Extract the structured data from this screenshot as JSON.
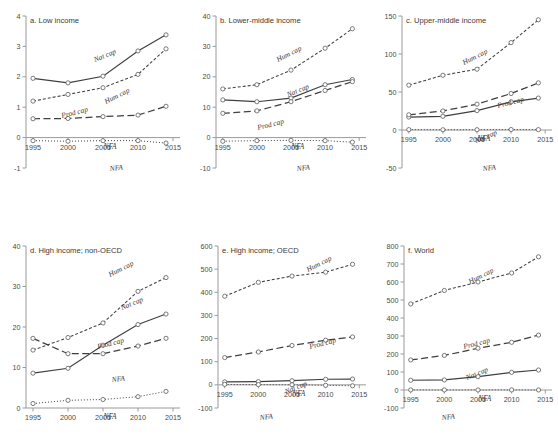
{
  "figure": {
    "title": "",
    "panel_count": 6,
    "xlabel": "",
    "x_categories": [
      1995,
      2000,
      2005,
      2010,
      2014
    ],
    "x_ticks": [
      "1995",
      "2000",
      "2005",
      "2010",
      "2015"
    ],
    "xlim": [
      1994,
      2016
    ],
    "nfa_axis_label": "NFA",
    "series_names": [
      "Nat cap",
      "Hum cap",
      "Prod cap",
      "NFA"
    ],
    "styles": {
      "Nat cap": "solid",
      "Hum cap": "short-dash",
      "Prod cap": "long-dash",
      "NFA": "dotted"
    },
    "colors": {
      "line": "#3f3f3f",
      "axis": "#9a9a9a",
      "text": "#3a3a3a",
      "marker_fill": "#ffffff"
    }
  },
  "chart_data": [
    {
      "type": "line",
      "panel": "a",
      "title": "a. Low income",
      "xlabel": "",
      "ylabel": "",
      "x": [
        1995,
        2000,
        2005,
        2010,
        2014
      ],
      "xticklabels": [
        "1995",
        "2000",
        "2005",
        "2010",
        "2015"
      ],
      "ylim": [
        -1,
        4
      ],
      "yticks": [
        -1,
        0,
        1,
        2,
        3,
        4
      ],
      "yticklabels": [
        "-1",
        "0",
        "1",
        "2",
        "3",
        "4"
      ],
      "grid": false,
      "legend": "inline-labels",
      "series": [
        {
          "name": "Nat cap",
          "values": [
            1.95,
            1.8,
            2.02,
            2.85,
            3.38
          ]
        },
        {
          "name": "Hum cap",
          "values": [
            1.2,
            1.42,
            1.64,
            2.08,
            2.92
          ]
        },
        {
          "name": "Prod cap",
          "values": [
            0.62,
            0.63,
            0.69,
            0.74,
            1.03
          ]
        },
        {
          "name": "NFA",
          "values": [
            -0.1,
            -0.12,
            -0.1,
            -0.1,
            -0.18
          ]
        }
      ]
    },
    {
      "type": "line",
      "panel": "b",
      "title": "b. Lower-middle income",
      "xlabel": "",
      "ylabel": "",
      "x": [
        1995,
        2000,
        2005,
        2010,
        2014
      ],
      "xticklabels": [
        "1995",
        "2000",
        "2005",
        "2010",
        "2015"
      ],
      "ylim": [
        -10,
        40
      ],
      "yticks": [
        -10,
        0,
        10,
        20,
        30,
        40
      ],
      "yticklabels": [
        "-10",
        "0",
        "10",
        "20",
        "30",
        "40"
      ],
      "grid": false,
      "legend": "inline-labels",
      "series": [
        {
          "name": "Nat cap",
          "values": [
            12.4,
            11.8,
            13.0,
            17.4,
            19.1
          ]
        },
        {
          "name": "Hum cap",
          "values": [
            16.0,
            17.4,
            22.2,
            29.4,
            35.8
          ]
        },
        {
          "name": "Prod cap",
          "values": [
            8.0,
            8.8,
            11.8,
            15.5,
            18.4
          ]
        },
        {
          "name": "NFA",
          "values": [
            -1.2,
            -1.0,
            -0.9,
            -1.0,
            -1.5
          ]
        }
      ]
    },
    {
      "type": "line",
      "panel": "c",
      "title": "c. Upper-middle income",
      "xlabel": "",
      "ylabel": "",
      "x": [
        1995,
        2000,
        2005,
        2010,
        2014
      ],
      "xticklabels": [
        "1995",
        "2000",
        "2005",
        "2010",
        "2015"
      ],
      "ylim": [
        -50,
        150
      ],
      "yticks": [
        -50,
        0,
        50,
        100,
        150
      ],
      "yticklabels": [
        "-50",
        "0",
        "50",
        "100",
        "150"
      ],
      "grid": false,
      "legend": "inline-labels",
      "series": [
        {
          "name": "Nat cap",
          "values": [
            17.0,
            18.0,
            25.5,
            37.0,
            42.0
          ]
        },
        {
          "name": "Hum cap",
          "values": [
            59.0,
            72.0,
            80.0,
            115.0,
            145.0
          ]
        },
        {
          "name": "Prod cap",
          "values": [
            20.0,
            25.0,
            34.0,
            48.0,
            62.0
          ]
        },
        {
          "name": "NFA",
          "values": [
            0.5,
            0.3,
            0.4,
            0.6,
            0.5
          ]
        }
      ]
    },
    {
      "type": "line",
      "panel": "d",
      "title": "d. High income; non-OECD",
      "xlabel": "",
      "ylabel": "",
      "x": [
        1995,
        2000,
        2005,
        2010,
        2014
      ],
      "xticklabels": [
        "1995",
        "2000",
        "2005",
        "2010",
        "2015"
      ],
      "ylim": [
        0,
        40
      ],
      "yticks": [
        0,
        10,
        20,
        30,
        40
      ],
      "yticklabels": [
        "0",
        "10",
        "20",
        "30",
        "40"
      ],
      "grid": false,
      "legend": "inline-labels",
      "series": [
        {
          "name": "Nat cap",
          "values": [
            8.6,
            9.8,
            15.5,
            20.6,
            23.2
          ]
        },
        {
          "name": "Hum cap",
          "values": [
            14.3,
            17.4,
            21.0,
            28.8,
            32.2
          ]
        },
        {
          "name": "Prod cap",
          "values": [
            17.2,
            13.4,
            13.4,
            15.3,
            17.2
          ]
        },
        {
          "name": "NFA",
          "values": [
            1.1,
            1.9,
            2.1,
            2.8,
            4.1
          ]
        }
      ]
    },
    {
      "type": "line",
      "panel": "e",
      "title": "e. High income; OECD",
      "xlabel": "",
      "ylabel": "",
      "x": [
        1995,
        2000,
        2005,
        2010,
        2014
      ],
      "xticklabels": [
        "1995",
        "2000",
        "2005",
        "2010",
        "2015"
      ],
      "ylim": [
        -100,
        600
      ],
      "yticks": [
        -100,
        0,
        100,
        200,
        300,
        400,
        500,
        600
      ],
      "yticklabels": [
        "-100",
        "0",
        "100",
        "200",
        "300",
        "400",
        "500",
        "600"
      ],
      "grid": false,
      "legend": "inline-labels",
      "series": [
        {
          "name": "Nat cap",
          "values": [
            13.0,
            14.0,
            18.0,
            24.0,
            25.0
          ]
        },
        {
          "name": "Hum cap",
          "values": [
            383.0,
            443.0,
            470.0,
            487.0,
            521.0
          ]
        },
        {
          "name": "Prod cap",
          "values": [
            118.0,
            142.0,
            170.0,
            193.0,
            207.0
          ]
        },
        {
          "name": "NFA",
          "values": [
            2.0,
            1.0,
            0.5,
            -2.0,
            -4.0
          ]
        }
      ]
    },
    {
      "type": "line",
      "panel": "f",
      "title": "f. World",
      "xlabel": "",
      "ylabel": "",
      "x": [
        1995,
        2000,
        2005,
        2010,
        2014
      ],
      "xticklabels": [
        "1995",
        "2000",
        "2005",
        "2010",
        "2015"
      ],
      "ylim": [
        -100,
        800
      ],
      "yticks": [
        -100,
        0,
        100,
        200,
        300,
        400,
        500,
        600,
        700,
        800
      ],
      "yticklabels": [
        "-100",
        "0",
        "100",
        "200",
        "300",
        "400",
        "500",
        "600",
        "700",
        "800"
      ],
      "grid": false,
      "legend": "inline-labels",
      "series": [
        {
          "name": "Nat cap",
          "values": [
            54.0,
            56.0,
            74.0,
            98.0,
            111.0
          ]
        },
        {
          "name": "Hum cap",
          "values": [
            478.0,
            553.0,
            600.0,
            650.0,
            740.0
          ]
        },
        {
          "name": "Prod cap",
          "values": [
            167.0,
            192.0,
            232.0,
            265.0,
            305.0
          ]
        },
        {
          "name": "NFA",
          "values": [
            0.5,
            0.3,
            0.4,
            0.5,
            0.3
          ]
        }
      ]
    }
  ],
  "series_label_positions": {
    "a": {
      "Nat cap": [
        95,
        62
      ],
      "Hum cap": [
        106,
        104
      ],
      "Prod cap": [
        62,
        118
      ],
      "NFA": [
        110,
        171
      ]
    },
    "b": {
      "Nat cap": [
        102,
        97
      ],
      "Hum cap": [
        92,
        62
      ],
      "Prod cap": [
        72,
        130
      ],
      "NFA": [
        111,
        171
      ]
    },
    "c": {
      "Nat cap": [
        104,
        143
      ],
      "Hum cap": [
        92,
        65
      ],
      "Prod cap": [
        126,
        108
      ],
      "NFA": [
        111,
        171
      ]
    },
    "d": {
      "Nat cap": [
        122,
        88
      ],
      "Hum cap": [
        110,
        55
      ],
      "Prod cap": [
        98,
        127
      ],
      "NFA": [
        112,
        160
      ]
    },
    "e": {
      "Nat cap": [
        100,
        172
      ],
      "Hum cap": [
        122,
        50
      ],
      "Prod cap": [
        124,
        127
      ],
      "NFA": [
        74,
        198
      ]
    },
    "f": {
      "Nat cap": [
        95,
        158
      ],
      "Hum cap": [
        98,
        62
      ],
      "Prod cap": [
        92,
        127
      ],
      "NFA": [
        70,
        198
      ]
    }
  }
}
